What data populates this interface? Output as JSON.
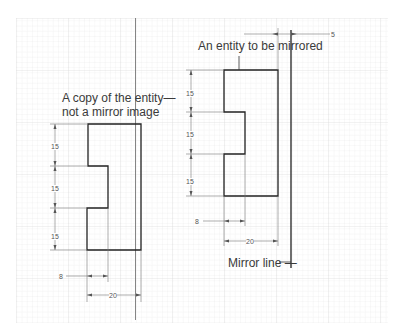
{
  "diagram": {
    "labels": {
      "copy_line1": "A copy of the entity—",
      "copy_line2": "not a mirror image",
      "entity": "An entity to be mirrored",
      "mirror_line": "Mirror line —"
    },
    "dimensions": {
      "offset": "5",
      "right_seg1": "15",
      "right_seg2": "15",
      "right_seg3": "15",
      "right_notch": "8",
      "right_width": "20",
      "left_seg1": "15",
      "left_seg2": "15",
      "left_seg3": "15",
      "left_notch": "8",
      "left_width": "20"
    },
    "colors": {
      "grid_minor": "#ececec",
      "grid_major": "#d6d6d6",
      "outline": "#222222",
      "dim_line": "#777777"
    }
  }
}
